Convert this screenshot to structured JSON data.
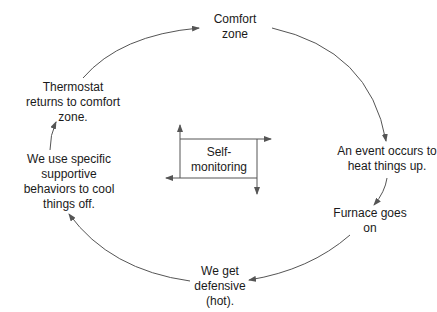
{
  "diagram": {
    "type": "cycle",
    "stroke_color": "#555555",
    "text_color": "#1a1a1a",
    "nodes": [
      {
        "id": "comfort",
        "lines": [
          "Comfort",
          "zone"
        ]
      },
      {
        "id": "event",
        "lines": [
          "An event occurs to",
          "heat things up."
        ]
      },
      {
        "id": "furnace",
        "lines": [
          "Furnace goes",
          "on"
        ]
      },
      {
        "id": "defensive",
        "lines": [
          "We get",
          "defensive",
          "(hot)."
        ]
      },
      {
        "id": "behaviors",
        "lines": [
          "We use specific",
          "supportive",
          "behaviors to cool",
          "things off."
        ]
      },
      {
        "id": "thermostat",
        "lines": [
          "Thermostat",
          "returns to comfort",
          "zone."
        ]
      }
    ],
    "center": {
      "id": "self-monitoring",
      "lines": [
        "Self-",
        "monitoring"
      ]
    },
    "edges": [
      {
        "from": "comfort",
        "to": "event"
      },
      {
        "from": "event",
        "to": "furnace"
      },
      {
        "from": "furnace",
        "to": "defensive"
      },
      {
        "from": "defensive",
        "to": "behaviors"
      },
      {
        "from": "behaviors",
        "to": "thermostat"
      },
      {
        "from": "thermostat",
        "to": "comfort"
      }
    ]
  }
}
